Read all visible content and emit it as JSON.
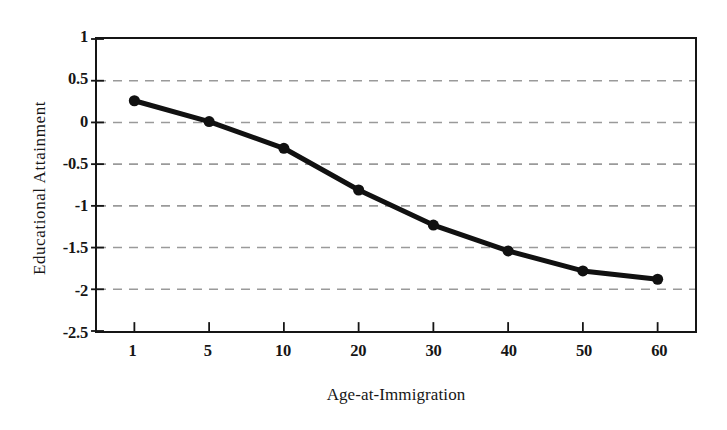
{
  "chart_data": {
    "type": "line",
    "title": "",
    "xlabel": "Age-at-Immigration",
    "ylabel": "Educational Attainment",
    "categories": [
      "1",
      "5",
      "10",
      "20",
      "30",
      "40",
      "50",
      "60"
    ],
    "values": [
      0.26,
      0.01,
      -0.31,
      -0.81,
      -1.23,
      -1.54,
      -1.78,
      -1.88
    ],
    "series": [
      {
        "name": "Educational Attainment",
        "values": [
          0.26,
          0.01,
          -0.31,
          -0.81,
          -1.23,
          -1.54,
          -1.78,
          -1.88
        ]
      }
    ],
    "ylim": [
      -2.5,
      1
    ],
    "yticks": [
      "1",
      "0.5",
      "0",
      "-0.5",
      "-1",
      "-1.5",
      "-2",
      "-2.5"
    ],
    "ytick_values": [
      1,
      0.5,
      0,
      -0.5,
      -1,
      -1.5,
      -2,
      -2.5
    ],
    "xticks": [
      "1",
      "5",
      "10",
      "20",
      "30",
      "40",
      "50",
      "60"
    ],
    "grid": "horizontal-dashed",
    "gridline_values": [
      0.5,
      0,
      -0.5,
      -1,
      -1.5,
      -2
    ],
    "legend": "none",
    "line_color": "#111111",
    "marker": "circle",
    "marker_color": "#111111",
    "grid_color": "#9a9a9a",
    "axis_color": "#151515",
    "background_color": "#ffffff"
  }
}
